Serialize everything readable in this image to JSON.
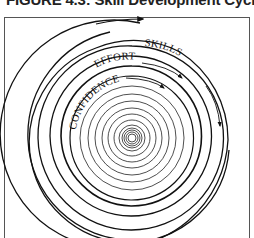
{
  "figure": {
    "title": "FIGURE 4.3: Skill Development Cycle",
    "labels": {
      "skills": "SKILLS",
      "effort": "EFFORT",
      "confidence": "CONFIDENCE"
    },
    "center": [
      132,
      138
    ],
    "colors": {
      "stroke": "#111111",
      "frame": "#555555",
      "background": "#ffffff"
    }
  }
}
